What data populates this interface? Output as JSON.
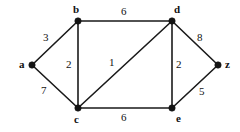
{
  "figure": {
    "kind": "weighted-undirected-graph",
    "background_color": "#ffffff",
    "stroke_color": "#1a1a1a",
    "text_color": "#111111"
  },
  "nodes": [
    {
      "id": "a",
      "label": "a",
      "x": 32,
      "y": 65,
      "label_x": 19,
      "label_y": 59
    },
    {
      "id": "b",
      "label": "b",
      "x": 78,
      "y": 21,
      "label_x": 73,
      "label_y": 4
    },
    {
      "id": "c",
      "label": "c",
      "x": 78,
      "y": 108,
      "label_x": 74,
      "label_y": 114
    },
    {
      "id": "d",
      "label": "d",
      "x": 172,
      "y": 21,
      "label_x": 174,
      "label_y": 4
    },
    {
      "id": "e",
      "label": "e",
      "x": 172,
      "y": 108,
      "label_x": 176,
      "label_y": 113
    },
    {
      "id": "z",
      "label": "z",
      "x": 218,
      "y": 65,
      "label_x": 225,
      "label_y": 59
    }
  ],
  "edges": [
    {
      "id": "a-b",
      "from": "a",
      "to": "b",
      "weight": "3",
      "label_x": 43,
      "label_y": 32
    },
    {
      "id": "a-c",
      "from": "a",
      "to": "c",
      "weight": "7",
      "label_x": 41,
      "label_y": 85
    },
    {
      "id": "b-d",
      "from": "b",
      "to": "d",
      "weight": "6",
      "label_x": 121,
      "label_y": 6
    },
    {
      "id": "b-c",
      "from": "b",
      "to": "c",
      "weight": "2",
      "label_x": 66,
      "label_y": 59
    },
    {
      "id": "c-d",
      "from": "c",
      "to": "d",
      "weight": "1",
      "label_x": 109,
      "label_y": 57
    },
    {
      "id": "c-e",
      "from": "c",
      "to": "e",
      "weight": "6",
      "label_x": 121,
      "label_y": 112
    },
    {
      "id": "d-e",
      "from": "d",
      "to": "e",
      "weight": "2",
      "label_x": 176,
      "label_y": 59
    },
    {
      "id": "d-z",
      "from": "d",
      "to": "z",
      "weight": "8",
      "label_x": 197,
      "label_y": 32
    },
    {
      "id": "e-z",
      "from": "e",
      "to": "z",
      "weight": "5",
      "label_x": 199,
      "label_y": 86
    }
  ]
}
